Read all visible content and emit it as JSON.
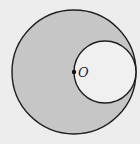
{
  "diagram": {
    "type": "geometry",
    "colors": {
      "background": "#ededed",
      "shaded_region": "#c6c6c6",
      "inner_circle_fill": "#f0f0f0",
      "stroke": "#1e1e1e"
    },
    "large_circle": {
      "cx": 74,
      "cy": 72,
      "r": 62
    },
    "small_circle": {
      "cx": 105,
      "cy": 72,
      "r": 31
    },
    "center_point": {
      "x": 74,
      "y": 72,
      "label": "O"
    }
  }
}
